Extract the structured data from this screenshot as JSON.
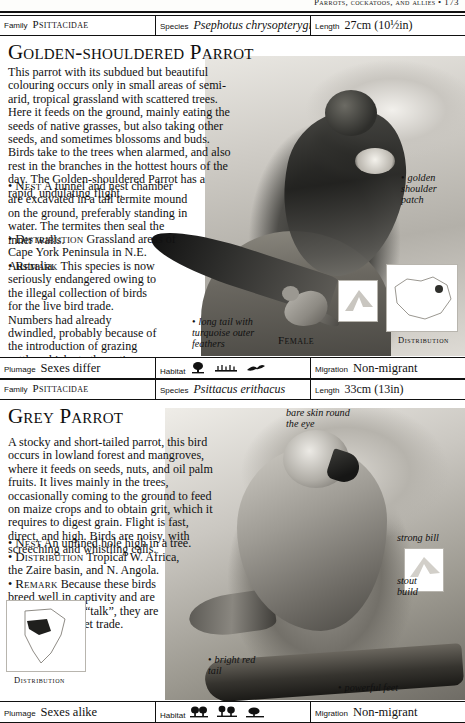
{
  "running_head": "Parrots, cockatoos, and allies   •   173",
  "entries": [
    {
      "id_bar": {
        "family_label": "Family",
        "family_value": "Psittacidae",
        "species_label": "Species",
        "species_value": "Psephotus chrysopterygius",
        "length_label": "Length",
        "length_value": "27cm (10½in)"
      },
      "common_name": "Golden-shouldered Parrot",
      "description": "This parrot with its subdued but beautiful colouring occurs only in small areas of semi-arid, tropical grassland with scattered trees. Here it feeds on the ground, mainly eating the seeds of native grasses, but also taking other seeds, and sometimes blossoms and buds. Birds take to the trees when alarmed, and also rest in the branches in the hottest hours of the day. The Golden-shouldered Parrot has a rapid, undulating flight.",
      "bullets": [
        {
          "head": "Nest",
          "text": "A tunnel and nest chamber are excavated in a tall termite mound on the ground, preferably standing in water. The termites then seal the inner walls."
        },
        {
          "head": "Distribution",
          "text": "Grassland areas of Cape York Peninsula in N.E. Australia."
        },
        {
          "head": "Remark",
          "text": "This species is now seriously endangered owing to the illegal collection of birds for the live bird trade. Numbers had already dwindled, probably because of the introduction of grazing cattle, which ate the native grasses."
        }
      ],
      "callouts": [
        {
          "text": "golden shoulder patch"
        },
        {
          "text": "long tail with turquoise outer feathers"
        }
      ],
      "female_label": "Female",
      "map_label": "Distribution",
      "data_bar": {
        "plumage_label": "Plumage",
        "plumage_value": "Sexes differ",
        "habitat_label": "Habitat",
        "habitat_icons": [
          "tree-icon",
          "grassland-icon",
          "bird-flight-icon"
        ],
        "migration_label": "Migration",
        "migration_value": "Non-migrant"
      }
    },
    {
      "id_bar": {
        "family_label": "Family",
        "family_value": "Psittacidae",
        "species_label": "Species",
        "species_value": "Psittacus erithacus",
        "length_label": "Length",
        "length_value": "33cm (13in)"
      },
      "common_name": "Grey Parrot",
      "description": "A stocky and short-tailed parrot, this bird occurs in lowland forest and mangroves, where it feeds on seeds, nuts, and oil palm fruits. It lives mainly in the trees, occasionally coming to the ground to feed on maize crops and to obtain grit, which it requires to digest grain. Flight is fast, direct, and high. Birds are noisy, with screeching and whistling calls.",
      "bullets": [
        {
          "head": "Nest",
          "text": "An unlined hole high in a tree."
        },
        {
          "head": "Distribution",
          "text": "Tropical W. Africa, the Zaire basin, and N. Angola."
        },
        {
          "head": "Remark",
          "text": "Because these birds breed well in captivity and are easily taught to “talk”, they are popular in the pet trade."
        }
      ],
      "callouts": [
        {
          "text": "bare skin round the eye"
        },
        {
          "text": "strong bill"
        },
        {
          "text": "stout build"
        },
        {
          "text": "bright red tail"
        },
        {
          "text": "powerful feet"
        }
      ],
      "map_label": "Distribution",
      "data_bar": {
        "plumage_label": "Plumage",
        "plumage_value": "Sexes alike",
        "habitat_label": "Habitat",
        "habitat_icons": [
          "forest-icon",
          "trees-icon",
          "scrub-icon"
        ],
        "migration_label": "Migration",
        "migration_value": "Non-migrant"
      }
    }
  ]
}
